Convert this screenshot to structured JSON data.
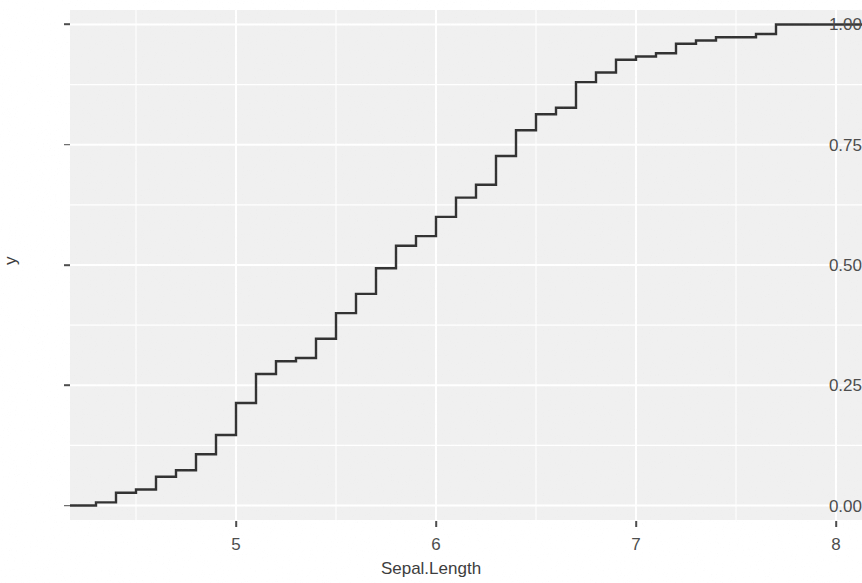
{
  "chart_data": {
    "type": "line",
    "subtype": "ecdf-step",
    "title": "",
    "subtitle": "",
    "xlabel": "Sepal.Length",
    "ylabel": "y",
    "xlim": [
      4.17,
      8.13
    ],
    "ylim": [
      -0.03,
      1.03
    ],
    "xticks": [
      5,
      6,
      7,
      8
    ],
    "xtick_labels": [
      "5",
      "6",
      "7",
      "8"
    ],
    "yticks": [
      0.0,
      0.25,
      0.5,
      0.75,
      1.0
    ],
    "ytick_labels": [
      "0.00",
      "0.25",
      "0.50",
      "0.75",
      "1.00"
    ],
    "grid": true,
    "grid_major_x": [
      5,
      6,
      7,
      8
    ],
    "grid_minor_x": [
      4.5,
      5.5,
      6.5,
      7.5
    ],
    "grid_major_y": [
      0.0,
      0.25,
      0.5,
      0.75,
      1.0
    ],
    "grid_minor_y": [
      0.125,
      0.375,
      0.625,
      0.875
    ],
    "legend": null,
    "legend_position": "none",
    "panel_background": "#f0f0f0",
    "grid_color": "#ffffff",
    "line_color": "#333333",
    "line_width": 2.4,
    "annotations": [],
    "x": [
      4.3,
      4.4,
      4.5,
      4.6,
      4.7,
      4.8,
      4.9,
      5.0,
      5.1,
      5.2,
      5.3,
      5.4,
      5.5,
      5.6,
      5.7,
      5.8,
      5.9,
      6.0,
      6.1,
      6.2,
      6.3,
      6.4,
      6.5,
      6.6,
      6.7,
      6.8,
      6.9,
      7.0,
      7.1,
      7.2,
      7.3,
      7.4,
      7.6,
      7.7,
      7.9
    ],
    "counts": [
      1,
      3,
      1,
      4,
      2,
      5,
      6,
      10,
      9,
      4,
      1,
      6,
      7,
      6,
      8,
      7,
      3,
      6,
      6,
      4,
      9,
      7,
      5,
      2,
      8,
      3,
      4,
      1,
      1,
      3,
      1,
      1,
      1,
      4,
      1
    ],
    "values": [
      0.0067,
      0.0267,
      0.0333,
      0.06,
      0.0733,
      0.1067,
      0.1467,
      0.2133,
      0.2733,
      0.3,
      0.3067,
      0.3467,
      0.4,
      0.44,
      0.4933,
      0.54,
      0.56,
      0.6,
      0.64,
      0.6667,
      0.7267,
      0.78,
      0.8133,
      0.8267,
      0.88,
      0.9,
      0.9267,
      0.9333,
      0.94,
      0.96,
      0.9667,
      0.9733,
      0.98,
      1.0,
      1.0
    ],
    "n_total": 150,
    "x_start": 4.17,
    "x_end": 8.13
  },
  "axes": {
    "x_title": "Sepal.Length",
    "y_title": "y"
  }
}
